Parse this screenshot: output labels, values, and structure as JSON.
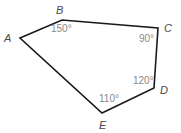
{
  "diagram": {
    "type": "pentagon",
    "stroke_color": "#1a1a1a",
    "vertices": [
      {
        "name": "A",
        "x": 20,
        "y": 38,
        "label_x": 4,
        "label_y": 42
      },
      {
        "name": "B",
        "x": 62,
        "y": 20,
        "label_x": 56,
        "label_y": 14
      },
      {
        "name": "C",
        "x": 158,
        "y": 28,
        "label_x": 164,
        "label_y": 32
      },
      {
        "name": "D",
        "x": 154,
        "y": 88,
        "label_x": 160,
        "label_y": 94
      },
      {
        "name": "E",
        "x": 102,
        "y": 113,
        "label_x": 99,
        "label_y": 129
      }
    ],
    "angles": [
      {
        "vertex": "B",
        "text": "150°",
        "x": 51,
        "y": 32
      },
      {
        "vertex": "C",
        "text": "90°",
        "x": 139,
        "y": 42
      },
      {
        "vertex": "D",
        "text": "120°",
        "x": 133,
        "y": 84
      },
      {
        "vertex": "E",
        "text": "110°",
        "x": 99,
        "y": 102
      }
    ]
  }
}
